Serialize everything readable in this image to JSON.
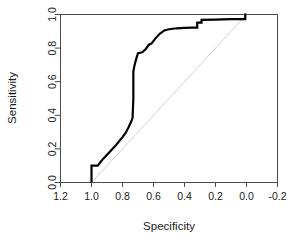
{
  "chart_data": {
    "type": "line",
    "title": "",
    "xlabel": "Specificity",
    "ylabel": "Sensitivity",
    "xlim": [
      1.2,
      -0.2
    ],
    "ylim": [
      0.0,
      1.0
    ],
    "x_reversed": true,
    "grid": false,
    "legend": "none",
    "xticks": [
      1.2,
      1.0,
      0.8,
      0.6,
      0.4,
      0.2,
      0.0,
      -0.2
    ],
    "xticklabels": [
      "1.2",
      "1.0",
      "0.8",
      "0.6",
      "0.4",
      "0.2",
      "0.0",
      "-0.2"
    ],
    "yticks": [
      0.0,
      0.2,
      0.4,
      0.6,
      0.8,
      1.0
    ],
    "yticklabels": [
      "0.0",
      "0.2",
      "0.4",
      "0.6",
      "0.8",
      "1.0"
    ],
    "series": [
      {
        "name": "ROC curve",
        "color": "#000000",
        "linewidth": 2.2,
        "points": [
          [
            1.0,
            0.0
          ],
          [
            1.0,
            0.1
          ],
          [
            0.96,
            0.1
          ],
          [
            0.93,
            0.135
          ],
          [
            0.88,
            0.185
          ],
          [
            0.84,
            0.225
          ],
          [
            0.8,
            0.27
          ],
          [
            0.78,
            0.295
          ],
          [
            0.76,
            0.33
          ],
          [
            0.745,
            0.36
          ],
          [
            0.735,
            0.385
          ],
          [
            0.73,
            0.5
          ],
          [
            0.73,
            0.66
          ],
          [
            0.722,
            0.7
          ],
          [
            0.71,
            0.74
          ],
          [
            0.7,
            0.77
          ],
          [
            0.672,
            0.775
          ],
          [
            0.65,
            0.795
          ],
          [
            0.63,
            0.82
          ],
          [
            0.612,
            0.828
          ],
          [
            0.59,
            0.855
          ],
          [
            0.56,
            0.885
          ],
          [
            0.53,
            0.905
          ],
          [
            0.5,
            0.912
          ],
          [
            0.45,
            0.918
          ],
          [
            0.4,
            0.92
          ],
          [
            0.35,
            0.922
          ],
          [
            0.318,
            0.922
          ],
          [
            0.318,
            0.952
          ],
          [
            0.29,
            0.952
          ],
          [
            0.29,
            0.968
          ],
          [
            0.2,
            0.97
          ],
          [
            0.1,
            0.972
          ],
          [
            0.02,
            0.973
          ],
          [
            0.008,
            0.973
          ],
          [
            0.008,
            1.0
          ],
          [
            0.0,
            1.0
          ]
        ]
      },
      {
        "name": "Chance diagonal",
        "color": "#d2d2d2",
        "linewidth": 1.0,
        "points": [
          [
            1.0,
            0.0
          ],
          [
            0.0,
            1.0
          ]
        ]
      }
    ]
  },
  "axes": {
    "x_title": "Specificity",
    "y_title": "Sensitivity",
    "box_color": "#4d4d4d"
  }
}
